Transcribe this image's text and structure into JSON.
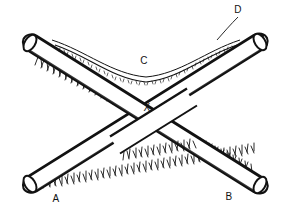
{
  "figure": {
    "background_color": "#ffffff",
    "ink_color": "#121212",
    "width": 293,
    "height": 217
  },
  "labels": {
    "a": "A",
    "b": "B",
    "c": "C",
    "d": "D",
    "x": "X"
  },
  "parts": {
    "rod_left": "rod-a-to-d",
    "rod_right": "rod-b-to-upper-left",
    "curve": "draped-curve-c",
    "leader_d": "leader-line-d",
    "crossing": "crossing-point-x"
  }
}
